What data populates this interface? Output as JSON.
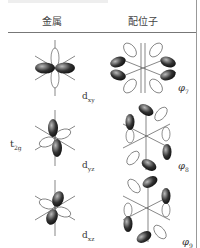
{
  "header": {
    "metal_label": "金属",
    "ligand_label": "配位子"
  },
  "group_label": {
    "main": "t",
    "sub": "2g"
  },
  "rows": [
    {
      "metal_orbital": {
        "main": "d",
        "sub": "xy"
      },
      "ligand_orbital": {
        "main": "φ",
        "sub": "7"
      }
    },
    {
      "metal_orbital": {
        "main": "d",
        "sub": "yz"
      },
      "ligand_orbital": {
        "main": "φ",
        "sub": "8"
      }
    },
    {
      "metal_orbital": {
        "main": "d",
        "sub": "xz"
      },
      "ligand_orbital": {
        "main": "φ",
        "sub": "9"
      }
    }
  ],
  "colors": {
    "lobe_dark": "#222222",
    "lobe_light": "#ffffff",
    "axis": "#555555",
    "rule": "#777777"
  }
}
